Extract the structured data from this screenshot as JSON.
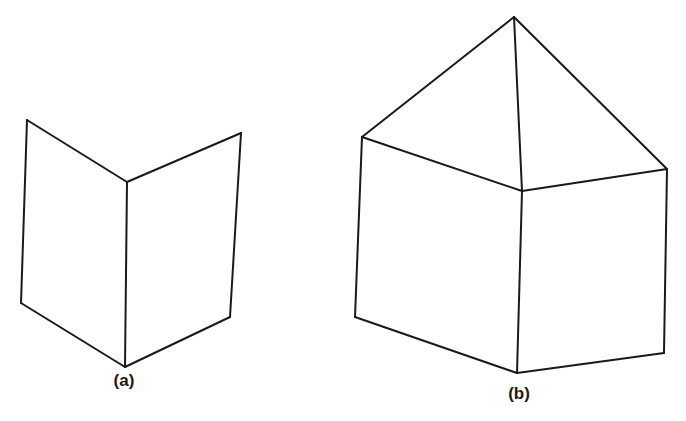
{
  "figure": {
    "background": "#ffffff",
    "stroke_color": "#1a1a1a",
    "panels": [
      {
        "id": "a",
        "label": "(a)",
        "description": "Two planar faces joined along a vertical fold edge (open book / folded card)",
        "label_position": [
          124,
          382
        ],
        "vertices": {
          "top_left": [
            27,
            120
          ],
          "top_fold": [
            127,
            182
          ],
          "top_right": [
            241,
            133
          ],
          "bottom_left": [
            21,
            303
          ],
          "bottom_fold": [
            125,
            367
          ],
          "bottom_right": [
            230,
            317
          ]
        },
        "edges": [
          [
            "top_left",
            "top_fold"
          ],
          [
            "top_fold",
            "top_right"
          ],
          [
            "top_left",
            "bottom_left"
          ],
          [
            "top_fold",
            "bottom_fold"
          ],
          [
            "top_right",
            "bottom_right"
          ],
          [
            "bottom_left",
            "bottom_fold"
          ],
          [
            "bottom_fold",
            "bottom_right"
          ]
        ]
      },
      {
        "id": "b",
        "label": "(b)",
        "description": "Folded pair of faces capped by two triangular faces meeting at an apex (house / roof shape)",
        "label_position": [
          519,
          395
        ],
        "vertices": {
          "apex": [
            514,
            17
          ],
          "top_left": [
            362,
            137
          ],
          "top_fold": [
            522,
            191
          ],
          "top_right": [
            667,
            169
          ],
          "bottom_left": [
            355,
            317
          ],
          "bottom_fold": [
            517,
            373
          ],
          "bottom_right": [
            664,
            353
          ]
        },
        "edges": [
          [
            "apex",
            "top_left"
          ],
          [
            "apex",
            "top_fold"
          ],
          [
            "apex",
            "top_right"
          ],
          [
            "top_left",
            "top_fold"
          ],
          [
            "top_fold",
            "top_right"
          ],
          [
            "top_left",
            "bottom_left"
          ],
          [
            "top_fold",
            "bottom_fold"
          ],
          [
            "top_right",
            "bottom_right"
          ],
          [
            "bottom_left",
            "bottom_fold"
          ],
          [
            "bottom_fold",
            "bottom_right"
          ]
        ]
      }
    ]
  }
}
